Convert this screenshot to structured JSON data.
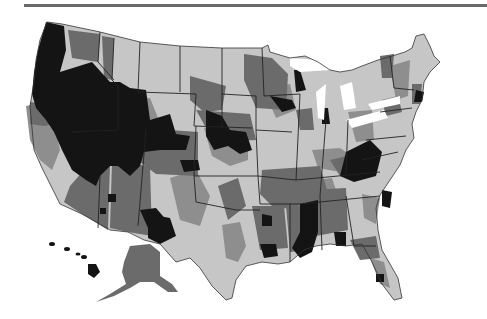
{
  "figure": {
    "type": "choropleth map",
    "region": "United States (with Alaska and Hawaii insets)",
    "palette": {
      "class_1_black": "#141414",
      "class_2_dark_gray": "#6b6b6b",
      "class_3_mid_gray": "#8e8e8e",
      "class_4_light_gray": "#c6c6c6",
      "background": "#ffffff",
      "top_rule": "#6a6a6a"
    },
    "legend": null,
    "title": null,
    "labels": []
  }
}
